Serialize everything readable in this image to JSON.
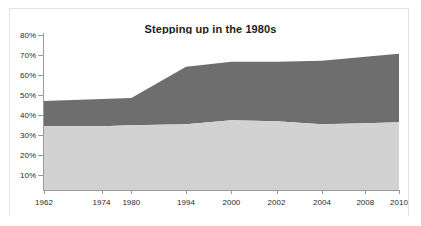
{
  "chart_data": {
    "type": "area",
    "title": "Stepping up in the 1980s",
    "xlabel": "",
    "ylabel": "",
    "stacked": true,
    "grid": false,
    "legend": "none",
    "ylim": [
      0,
      80
    ],
    "ytick_labels": [
      "80%",
      "70%",
      "60%",
      "50%",
      "40%",
      "30%",
      "20%",
      "10%"
    ],
    "ytick_values": [
      80,
      70,
      60,
      50,
      40,
      30,
      20,
      10
    ],
    "categories": [
      "1962",
      "1974",
      "1980",
      "1994",
      "2000",
      "2002",
      "2004",
      "2008",
      "2010"
    ],
    "x": [
      1962,
      1974,
      1980,
      1994,
      2000,
      2002,
      2004,
      2008,
      2010
    ],
    "series": [
      {
        "name": "lower-band",
        "color": "#d2d2d2",
        "values": [
          34.5,
          34.5,
          35.0,
          35.5,
          37.5,
          37.0,
          35.5,
          36.0,
          36.5
        ]
      },
      {
        "name": "upper-band",
        "color": "#6e6e6e",
        "values": [
          12.5,
          13.5,
          13.5,
          28.5,
          29.0,
          29.5,
          31.5,
          33.0,
          34.0
        ]
      }
    ],
    "cumulative_top": [
      47.0,
      48.0,
      48.5,
      64.0,
      66.5,
      66.5,
      67.0,
      69.0,
      70.5
    ],
    "colors": {
      "upper_area": "#6e6e6e",
      "lower_area": "#d2d2d2",
      "axis": "#9a9a9a",
      "text": "#2a2a2a",
      "background": "#ffffff",
      "frame": "#e3e3e3"
    }
  }
}
